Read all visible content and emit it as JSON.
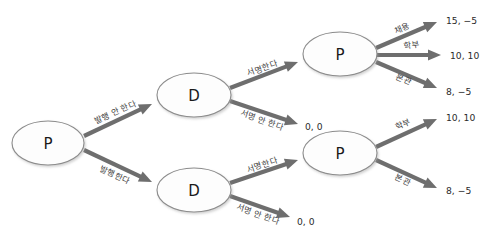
{
  "diagram": {
    "title": "",
    "type": "game-tree",
    "colors": {
      "node_fill": "#fdfdfd",
      "node_stroke": "#8c8c8c",
      "edge": "#6e6e6e",
      "text": "#1a1a1a",
      "background": "#ffffff"
    },
    "nodes": [
      {
        "id": "root",
        "label": "P",
        "cx": 48,
        "cy": 143,
        "rx": 36,
        "ry": 22
      },
      {
        "id": "d_top",
        "label": "D",
        "cx": 194,
        "cy": 95,
        "rx": 37,
        "ry": 22
      },
      {
        "id": "d_bot",
        "label": "D",
        "cx": 194,
        "cy": 190,
        "rx": 37,
        "ry": 22
      },
      {
        "id": "p_top",
        "label": "P",
        "cx": 340,
        "cy": 54,
        "rx": 37,
        "ry": 22
      },
      {
        "id": "p_bot",
        "label": "P",
        "cx": 340,
        "cy": 153,
        "rx": 37,
        "ry": 22
      }
    ],
    "edges": [
      {
        "id": "e1",
        "from": "root",
        "to": "d_top",
        "label": "발행 안 한다",
        "x1": 84,
        "y1": 136,
        "x2": 152,
        "y2": 104,
        "lx": 115,
        "ly": 112,
        "rot": -24
      },
      {
        "id": "e2",
        "from": "root",
        "to": "d_bot",
        "label": "발행한다",
        "x1": 84,
        "y1": 150,
        "x2": 152,
        "y2": 182,
        "lx": 115,
        "ly": 175,
        "rot": 24
      },
      {
        "id": "e3",
        "from": "d_top",
        "to": "p_top",
        "label": "서명한다",
        "x1": 230,
        "y1": 88,
        "x2": 298,
        "y2": 62,
        "lx": 262,
        "ly": 68,
        "rot": -20
      },
      {
        "id": "e4",
        "from": "d_top",
        "to": "payoff_top_zero",
        "label": "서명 안 한다",
        "x1": 230,
        "y1": 101,
        "x2": 298,
        "y2": 124,
        "lx": 262,
        "ly": 120,
        "rot": 19
      },
      {
        "id": "e5",
        "from": "d_bot",
        "to": "p_bot",
        "label": "서명한다",
        "x1": 230,
        "y1": 183,
        "x2": 298,
        "y2": 160,
        "lx": 262,
        "ly": 165,
        "rot": -19
      },
      {
        "id": "e6",
        "from": "d_bot",
        "to": "payoff_bot_zero",
        "label": "서명 안 한다",
        "x1": 230,
        "y1": 196,
        "x2": 290,
        "y2": 217,
        "lx": 258,
        "ly": 214,
        "rot": 19
      },
      {
        "id": "e7",
        "from": "p_top",
        "to": "payoff_1",
        "label": "채용",
        "x1": 376,
        "y1": 48,
        "x2": 437,
        "y2": 22,
        "lx": 402,
        "ly": 28,
        "rot": -23
      },
      {
        "id": "e8",
        "from": "p_top",
        "to": "payoff_2",
        "label": "학부",
        "x1": 376,
        "y1": 55,
        "x2": 441,
        "y2": 55,
        "lx": 412,
        "ly": 45,
        "rot": -8
      },
      {
        "id": "e9",
        "from": "p_top",
        "to": "payoff_3",
        "label": "본관",
        "x1": 376,
        "y1": 62,
        "x2": 437,
        "y2": 88,
        "lx": 404,
        "ly": 79,
        "rot": 23
      },
      {
        "id": "e10",
        "from": "p_bot",
        "to": "payoff_4",
        "label": "학부",
        "x1": 376,
        "y1": 147,
        "x2": 437,
        "y2": 119,
        "lx": 403,
        "ly": 124,
        "rot": -24
      },
      {
        "id": "e11",
        "from": "p_bot",
        "to": "payoff_5",
        "label": "본관",
        "x1": 376,
        "y1": 160,
        "x2": 437,
        "y2": 188,
        "lx": 403,
        "ly": 180,
        "rot": 24
      }
    ],
    "payoffs": [
      {
        "id": "payoff_1",
        "text": "15, −5",
        "x": 446,
        "y": 20
      },
      {
        "id": "payoff_2",
        "text": "10, 10",
        "x": 450,
        "y": 55
      },
      {
        "id": "payoff_3",
        "text": "8, −5",
        "x": 446,
        "y": 91
      },
      {
        "id": "payoff_top_zero",
        "text": "0, 0",
        "x": 305,
        "y": 126
      },
      {
        "id": "payoff_4",
        "text": "10, 10",
        "x": 446,
        "y": 117
      },
      {
        "id": "payoff_5",
        "text": "8, −5",
        "x": 446,
        "y": 190
      },
      {
        "id": "payoff_bot_zero",
        "text": "0, 0",
        "x": 297,
        "y": 221
      }
    ]
  }
}
